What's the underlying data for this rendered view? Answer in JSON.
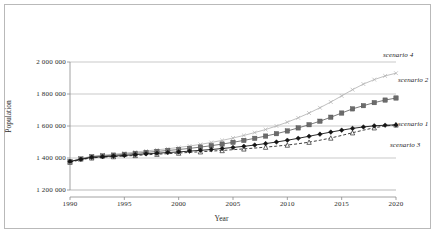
{
  "chart_data": {
    "type": "line",
    "title": "",
    "xlabel": "Year",
    "ylabel": "Population",
    "xlim": [
      1990,
      2020
    ],
    "ylim": [
      1200000,
      2000000
    ],
    "grid": true,
    "grid_axis": "y",
    "legend": "inline-right-annotations",
    "xticks": [
      "1990",
      "1995",
      "2000",
      "2005",
      "2010",
      "2015",
      "2020"
    ],
    "xtick_values": [
      1990,
      1995,
      2000,
      2005,
      2010,
      2015,
      2020
    ],
    "yticks": [
      "1 200 000",
      "1 400 000",
      "1 600 000",
      "1 800 000",
      "2 000 000"
    ],
    "ytick_values": [
      1200000,
      1400000,
      1600000,
      1800000,
      2000000
    ],
    "x": [
      1990,
      1991,
      1992,
      1993,
      1994,
      1995,
      1996,
      1997,
      1998,
      1999,
      2000,
      2001,
      2002,
      2003,
      2004,
      2005,
      2006,
      2007,
      2008,
      2009,
      2010,
      2011,
      2012,
      2013,
      2014,
      2015,
      2016,
      2017,
      2018,
      2019,
      2020
    ],
    "series": [
      {
        "name": "scenario 1",
        "marker": "diamond",
        "color": "#151515",
        "linestyle": "solid",
        "label_x": 2020,
        "label_y": 1605000,
        "values": [
          1378000,
          1392000,
          1404000,
          1408000,
          1412000,
          1416000,
          1421000,
          1426000,
          1430000,
          1434000,
          1438000,
          1443000,
          1448000,
          1453000,
          1459000,
          1466000,
          1473000,
          1481000,
          1490000,
          1500000,
          1511000,
          1523000,
          1536000,
          1549000,
          1562000,
          1574000,
          1585000,
          1594000,
          1601000,
          1605000,
          1607000
        ]
      },
      {
        "name": "scenario 2",
        "marker": "square",
        "color": "#6b6b6b",
        "linestyle": "solid",
        "label_x": 2020,
        "label_y": 1830000,
        "values": [
          1378000,
          1394000,
          1408000,
          1413000,
          1418000,
          1423000,
          1429000,
          1435000,
          1441000,
          1447000,
          1453000,
          1460000,
          1468000,
          1477000,
          1487000,
          1498000,
          1510000,
          1523000,
          1537000,
          1552000,
          1569000,
          1588000,
          1608000,
          1630000,
          1655000,
          1681000,
          1707000,
          1727000,
          1746000,
          1762000,
          1775000
        ]
      },
      {
        "name": "scenario 3",
        "marker": "triangle",
        "color": "#2a2a2a",
        "linestyle": "dashed",
        "label_x": 2020,
        "label_y": 1492000,
        "values": [
          1374000,
          1389000,
          1401000,
          1405000,
          1409000,
          1412000,
          1416000,
          1420000,
          1424000,
          1427000,
          1431000,
          1435000,
          1439000,
          1443000,
          1447000,
          1452000,
          1457000,
          1462000,
          1468000,
          1474000,
          1481000,
          1489000,
          1499000,
          1511000,
          1525000,
          1541000,
          1558000,
          1574000,
          1589000,
          1600000,
          1607000
        ]
      },
      {
        "name": "scenario 4",
        "marker": "x",
        "color": "#b0b0b0",
        "linestyle": "solid",
        "label_x": 2020,
        "label_y": 1970000,
        "values": [
          1378000,
          1396000,
          1411000,
          1418000,
          1424000,
          1430000,
          1437000,
          1444000,
          1451000,
          1458000,
          1466000,
          1475000,
          1485000,
          1497000,
          1510000,
          1525000,
          1541000,
          1559000,
          1578000,
          1600000,
          1624000,
          1651000,
          1681000,
          1714000,
          1750000,
          1788000,
          1827000,
          1862000,
          1890000,
          1913000,
          1930000
        ]
      }
    ]
  },
  "axes": {
    "y_title": "Population",
    "x_title": "Year"
  },
  "colors": {
    "frame_border": "#b9b9b9",
    "gridline": "#a6a6a6",
    "axis_line": "#8c8c8c",
    "text": "#2b2b2b"
  }
}
